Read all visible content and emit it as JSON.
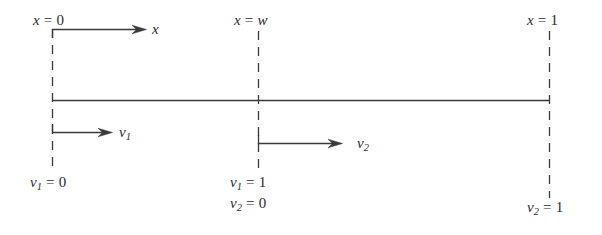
{
  "figure": {
    "background_color": "#ffffff",
    "line_color": "#3a3a3a",
    "text_color": "#2b2b2b",
    "width": 602,
    "height": 235
  },
  "axis": {
    "baseline_y": 100,
    "left_x": 52,
    "interface_x": 258,
    "right_x": 549
  },
  "labels": {
    "x_left": {
      "var": "x",
      "rel": "=",
      "val": "0"
    },
    "x_mid": {
      "var": "x",
      "rel": "=",
      "val": "w"
    },
    "x_right": {
      "var": "x",
      "rel": "=",
      "val": "1"
    },
    "arrow_x": {
      "var": "x",
      "sub": ""
    },
    "arrow_v1": {
      "var": "v",
      "sub": "1"
    },
    "arrow_v2": {
      "var": "v",
      "sub": "2"
    },
    "v1_left": {
      "var": "v",
      "sub": "1",
      "rel": "=",
      "val": "0"
    },
    "v1_mid": {
      "var": "v",
      "sub": "1",
      "rel": "=",
      "val": "1"
    },
    "v2_mid": {
      "var": "v",
      "sub": "2",
      "rel": "=",
      "val": "0"
    },
    "v2_right": {
      "var": "v",
      "sub": "2",
      "rel": "=",
      "val": "1"
    }
  }
}
